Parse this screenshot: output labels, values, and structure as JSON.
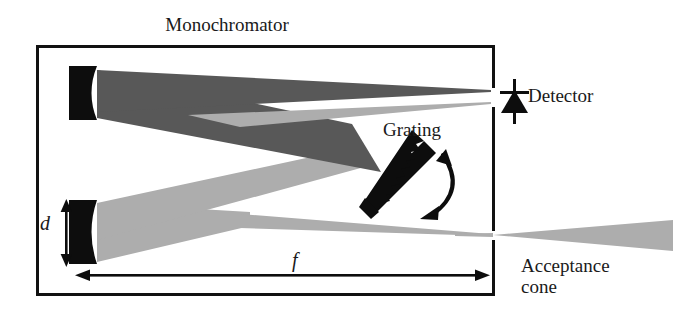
{
  "figure": {
    "kind": "optical-schematic",
    "title": "Monochromator",
    "width_px": 673,
    "height_px": 317,
    "background": "#ffffff"
  },
  "labels": {
    "title": "Monochromator",
    "detector": "Detector",
    "grating": "Grating",
    "acceptance_cone_line1": "Acceptance",
    "acceptance_cone_line2": "cone",
    "slit_height_symbol": "d",
    "focal_length_symbol": "f"
  },
  "colors": {
    "outline": "#111111",
    "beam_dark": "#585858",
    "beam_light": "#adadad",
    "solid_black": "#0d0d0d",
    "page_background": "#ffffff",
    "text": "#1a1a1a"
  },
  "components": [
    {
      "name": "enclosure",
      "label": "Monochromator housing",
      "shape": "rectangle"
    },
    {
      "name": "entrance-mirror",
      "label": "Lower collimating mirror",
      "shape": "concave-mirror"
    },
    {
      "name": "exit-mirror",
      "label": "Upper focusing mirror",
      "shape": "concave-mirror"
    },
    {
      "name": "grating",
      "label": "Grating",
      "shape": "sawtooth-blazed"
    },
    {
      "name": "grating-rotation-arrow",
      "label": "Grating rotation",
      "shape": "double-curved-arrow"
    },
    {
      "name": "detector",
      "label": "Detector",
      "shape": "photodiode-symbol"
    },
    {
      "name": "acceptance-cone",
      "label": "Acceptance cone",
      "shape": "diverging-cone"
    }
  ],
  "dimensions": [
    {
      "name": "slit-height",
      "symbol": "d",
      "orientation": "vertical",
      "arrow": "double-headed"
    },
    {
      "name": "focal-length",
      "symbol": "f",
      "orientation": "horizontal",
      "arrow": "double-headed"
    }
  ],
  "beams": [
    {
      "name": "lower-input-beam",
      "tone": "beam_light",
      "from": "entrance-mirror",
      "to": "grating"
    },
    {
      "name": "grating-to-upper-mirror",
      "tone": "beam_dark",
      "from": "grating",
      "to": "exit-mirror"
    },
    {
      "name": "upper-mirror-to-exit-slit",
      "tone": "beam_dark",
      "from": "exit-mirror",
      "to": "detector"
    },
    {
      "name": "second-order-exit-beam",
      "tone": "beam_light",
      "from": "exit-mirror",
      "to": "detector"
    },
    {
      "name": "entrance-slit-beam",
      "tone": "beam_light",
      "from": "entrance-slit",
      "to": "entrance-mirror"
    },
    {
      "name": "acceptance-cone-beam",
      "tone": "beam_light",
      "from": "entrance-slit",
      "to": "outside"
    }
  ]
}
